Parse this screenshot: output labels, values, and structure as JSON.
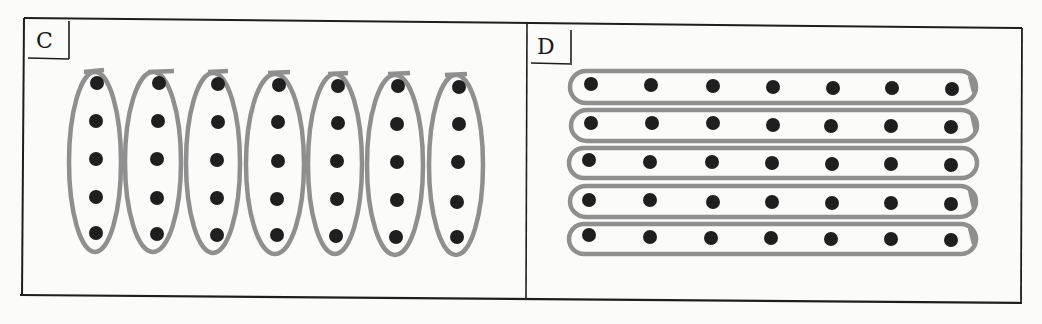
{
  "diagram": {
    "colors": {
      "background": "#fbfbf9",
      "frame": "#1e1e1e",
      "dot": "#1f1f1f",
      "loop": "#8f8f8f"
    },
    "panels": [
      {
        "id": "C",
        "label": "C",
        "rows": 5,
        "columns": 7,
        "grouping": "columns",
        "group_count": 7,
        "dots_per_group": 5,
        "total_dots": 35
      },
      {
        "id": "D",
        "label": "D",
        "rows": 5,
        "columns": 7,
        "grouping": "rows",
        "group_count": 5,
        "dots_per_group": 7,
        "total_dots": 35
      }
    ]
  }
}
